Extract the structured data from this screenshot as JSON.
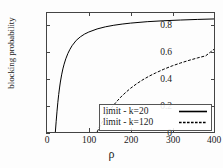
{
  "chart_data": {
    "type": "line",
    "title": "",
    "xlabel": "ρ",
    "ylabel": "blocking probability",
    "xlim": [
      0,
      400
    ],
    "ylim": [
      0,
      1.0
    ],
    "grid": false,
    "legend_position": "bottom-right",
    "xticks": [
      {
        "value": 0,
        "label": "0"
      },
      {
        "value": 100,
        "label": "100"
      },
      {
        "value": 200,
        "label": "200"
      },
      {
        "value": 300,
        "label": "300"
      },
      {
        "value": 400,
        "label": "400"
      }
    ],
    "yticks": [
      {
        "value": 0,
        "label": "0"
      },
      {
        "value": 0.2,
        "label": "0.2"
      },
      {
        "value": 0.4,
        "label": "0.4"
      },
      {
        "value": 0.6,
        "label": "0.6"
      },
      {
        "value": 0.8,
        "label": "0.8"
      }
    ],
    "series": [
      {
        "name": "limit - k=20",
        "style": "solid",
        "color": "#000000",
        "x": [
          20,
          22,
          24,
          26,
          28,
          30,
          32,
          35,
          38,
          41,
          45,
          50,
          55,
          60,
          70,
          80,
          90,
          100,
          120,
          140,
          160,
          180,
          200,
          240,
          280,
          320,
          360,
          400
        ],
        "y": [
          0.0,
          0.09,
          0.175,
          0.25,
          0.315,
          0.37,
          0.42,
          0.48,
          0.53,
          0.57,
          0.615,
          0.66,
          0.695,
          0.725,
          0.77,
          0.8,
          0.823,
          0.84,
          0.866,
          0.884,
          0.897,
          0.907,
          0.915,
          0.927,
          0.935,
          0.941,
          0.946,
          0.95
        ]
      },
      {
        "name": "limit - k=120",
        "style": "dashed",
        "color": "#000000",
        "x": [
          120,
          125,
          130,
          136,
          142,
          150,
          160,
          170,
          180,
          190,
          200,
          215,
          230,
          245,
          260,
          280,
          300,
          320,
          340,
          360,
          380,
          400
        ],
        "y": [
          0.0,
          0.035,
          0.07,
          0.105,
          0.14,
          0.182,
          0.228,
          0.268,
          0.305,
          0.337,
          0.367,
          0.406,
          0.44,
          0.47,
          0.496,
          0.528,
          0.556,
          0.58,
          0.602,
          0.622,
          0.64,
          0.695
        ]
      }
    ]
  },
  "legend": {
    "items": [
      {
        "label": "limit - k=20"
      },
      {
        "label": "limit - k=120"
      }
    ]
  }
}
